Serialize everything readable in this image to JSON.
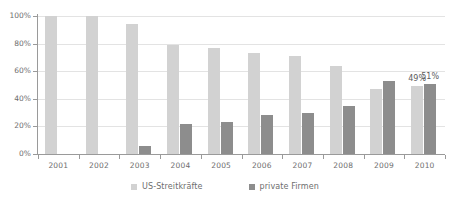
{
  "chart_data": {
    "type": "bar",
    "title": "",
    "subtitle": "",
    "xlabel": "",
    "ylabel": "",
    "ylim": [
      0,
      100
    ],
    "ytick_labels": [
      "0%",
      "20%",
      "40%",
      "60%",
      "80%",
      "100%"
    ],
    "ytick_values": [
      0,
      20,
      40,
      60,
      80,
      100
    ],
    "grid": true,
    "legend_position": "bottom",
    "categories": [
      "2001",
      "2002",
      "2003",
      "2004",
      "2005",
      "2006",
      "2007",
      "2008",
      "2009",
      "2010"
    ],
    "series": [
      {
        "name": "US-Streitkräfte",
        "color": "#d2d2d2",
        "values": [
          100,
          100,
          94,
          79,
          77,
          73,
          71,
          64,
          47,
          49
        ]
      },
      {
        "name": "private Firmen",
        "color": "#8d8d8d",
        "values": [
          0,
          0,
          6,
          22,
          23,
          28,
          30,
          35,
          53,
          51
        ]
      }
    ],
    "annotations": [
      {
        "text": "49%",
        "category": "2010",
        "series": "US-Streitkräfte"
      },
      {
        "text": "51%",
        "category": "2010",
        "series": "private Firmen"
      }
    ]
  },
  "legend": {
    "items": [
      {
        "label": "US-Streitkräfte",
        "color": "#d2d2d2",
        "swatch_name": "legend-swatch-us-streitkraefte"
      },
      {
        "label": "private Firmen",
        "color": "#8d8d8d",
        "swatch_name": "legend-swatch-private-firmen"
      }
    ]
  },
  "colors": {
    "series_light": "#d2d2d2",
    "series_dark": "#8d8d8d",
    "gridline": "#e3e3e3",
    "axis": "#9a9a9a",
    "text": "#6e6e6e",
    "background": "#ffffff"
  }
}
